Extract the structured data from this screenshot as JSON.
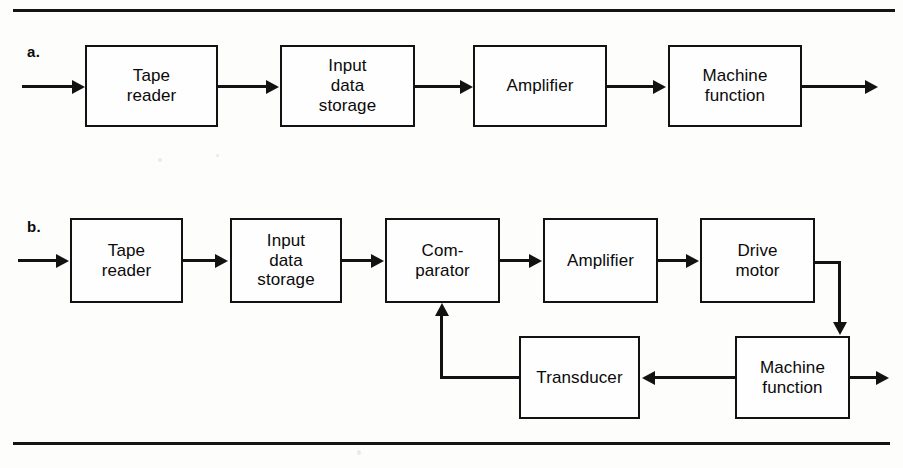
{
  "figure": {
    "background_color": "#fdfdfc",
    "ink_color": "#121212",
    "rules": {
      "top": "",
      "bottom": ""
    }
  },
  "diagrams": [
    {
      "id": "a",
      "label": "a.",
      "caption": "Open-loop machine control block diagram",
      "blocks": [
        {
          "id": "a-tape-reader",
          "lines": [
            "Tape",
            "reader"
          ],
          "x": 85,
          "y": 45,
          "w": 133,
          "h": 82
        },
        {
          "id": "a-input-storage",
          "lines": [
            "Input",
            "data",
            "storage"
          ],
          "x": 280,
          "y": 45,
          "w": 135,
          "h": 82
        },
        {
          "id": "a-amplifier",
          "lines": [
            "Amplifier"
          ],
          "x": 473,
          "y": 45,
          "w": 134,
          "h": 82
        },
        {
          "id": "a-machine-function",
          "lines": [
            "Machine",
            "function"
          ],
          "x": 668,
          "y": 45,
          "w": 134,
          "h": 82
        }
      ],
      "connections": [
        {
          "id": "a-input-arrow",
          "from": "input",
          "to": "a-tape-reader"
        },
        {
          "id": "a-conn-1",
          "from": "a-tape-reader",
          "to": "a-input-storage"
        },
        {
          "id": "a-conn-2",
          "from": "a-input-storage",
          "to": "a-amplifier"
        },
        {
          "id": "a-conn-3",
          "from": "a-amplifier",
          "to": "a-machine-function"
        },
        {
          "id": "a-output-arrow",
          "from": "a-machine-function",
          "to": "output"
        }
      ]
    },
    {
      "id": "b",
      "label": "b.",
      "caption": "Closed-loop machine control block diagram with feedback",
      "blocks": [
        {
          "id": "b-tape-reader",
          "lines": [
            "Tape",
            "reader"
          ],
          "x": 70,
          "y": 218,
          "w": 113,
          "h": 85
        },
        {
          "id": "b-input-storage",
          "lines": [
            "Input",
            "data",
            "storage"
          ],
          "x": 230,
          "y": 218,
          "w": 112,
          "h": 85
        },
        {
          "id": "b-comparator",
          "lines": [
            "Com-",
            "parator"
          ],
          "x": 385,
          "y": 218,
          "w": 115,
          "h": 85
        },
        {
          "id": "b-amplifier",
          "lines": [
            "Amplifier"
          ],
          "x": 543,
          "y": 218,
          "w": 115,
          "h": 85
        },
        {
          "id": "b-drive-motor",
          "lines": [
            "Drive",
            "motor"
          ],
          "x": 700,
          "y": 218,
          "w": 115,
          "h": 85
        },
        {
          "id": "b-transducer",
          "lines": [
            "Transducer"
          ],
          "x": 519,
          "y": 336,
          "w": 121,
          "h": 83
        },
        {
          "id": "b-machine-function",
          "lines": [
            "Machine",
            "function"
          ],
          "x": 735,
          "y": 336,
          "w": 115,
          "h": 83
        }
      ],
      "connections": [
        {
          "id": "b-input-arrow",
          "from": "input",
          "to": "b-tape-reader"
        },
        {
          "id": "b-conn-1",
          "from": "b-tape-reader",
          "to": "b-input-storage"
        },
        {
          "id": "b-conn-2",
          "from": "b-input-storage",
          "to": "b-comparator"
        },
        {
          "id": "b-conn-3",
          "from": "b-comparator",
          "to": "b-amplifier"
        },
        {
          "id": "b-conn-4",
          "from": "b-amplifier",
          "to": "b-drive-motor"
        },
        {
          "id": "b-drive-to-machine",
          "from": "b-drive-motor",
          "to": "b-machine-function"
        },
        {
          "id": "b-machine-to-transducer",
          "from": "b-machine-function",
          "to": "b-transducer"
        },
        {
          "id": "b-feedback",
          "from": "b-transducer",
          "to": "b-comparator"
        },
        {
          "id": "b-output-arrow",
          "from": "b-machine-function",
          "to": "output"
        }
      ]
    }
  ]
}
